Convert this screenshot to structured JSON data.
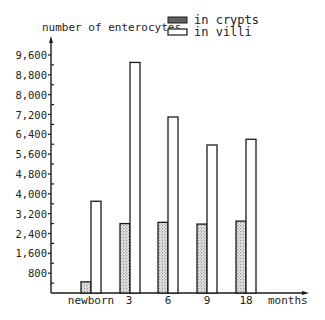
{
  "chart_data": {
    "type": "bar",
    "title": "",
    "ylabel": "number of enterocytes",
    "xlabel": "months",
    "categories": [
      "newborn",
      "3",
      "6",
      "9",
      "18"
    ],
    "series": [
      {
        "name": "in crypts",
        "pattern": "stippled",
        "values": [
          450,
          2800,
          2850,
          2780,
          2900
        ]
      },
      {
        "name": "in villi",
        "pattern": "open",
        "values": [
          3700,
          9300,
          7100,
          5970,
          6200
        ]
      }
    ],
    "ylim": [
      0,
      9600
    ],
    "yticks": [
      800,
      1600,
      2400,
      3200,
      4000,
      4800,
      5600,
      6400,
      7200,
      8000,
      8800,
      9600
    ],
    "ytick_labels": [
      "800",
      "1,600",
      "2,400",
      "3,200",
      "4,000",
      "4,800",
      "5,600",
      "6,400",
      "7,200",
      "8,000",
      "8,800",
      "9,600"
    ],
    "grid": false,
    "legend_position": "top-right"
  },
  "colors": {
    "ink": "#1a1a1a",
    "crypts_fill": "#bdbdbd",
    "villi_fill": "#ffffff"
  }
}
